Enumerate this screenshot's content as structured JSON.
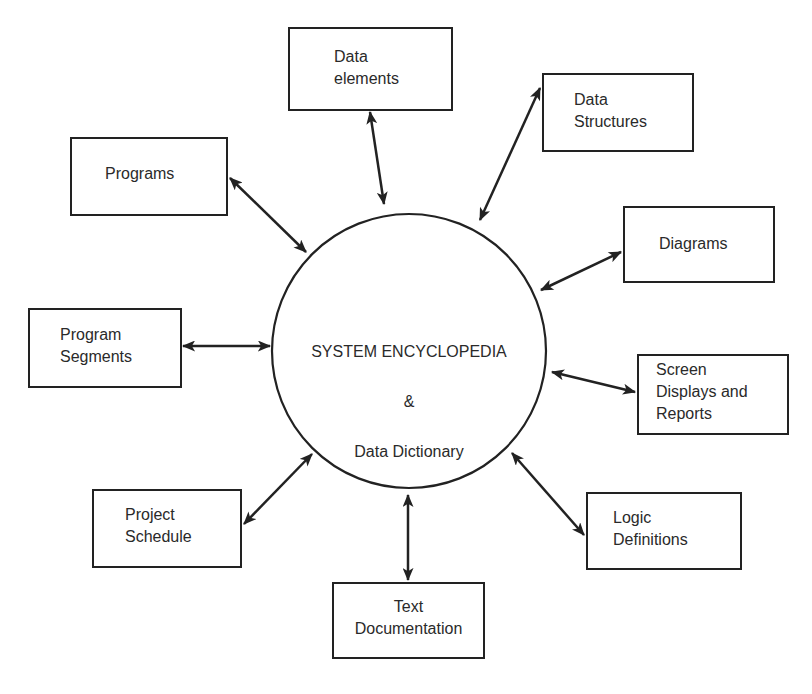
{
  "diagram": {
    "center": {
      "title": "SYSTEM ENCYCLOPEDIA",
      "ampersand": "&",
      "subtitle": "Data Dictionary"
    },
    "nodes": [
      {
        "id": "data-elements",
        "label": "Data\nelements"
      },
      {
        "id": "data-structures",
        "label": "Data\nStructures"
      },
      {
        "id": "programs",
        "label": "Programs"
      },
      {
        "id": "diagrams",
        "label": "Diagrams"
      },
      {
        "id": "program-segments",
        "label": "Program\nSegments"
      },
      {
        "id": "screen-displays-reports",
        "label": "Screen\nDisplays and\nReports"
      },
      {
        "id": "project-schedule",
        "label": "Project\nSchedule"
      },
      {
        "id": "logic-definitions",
        "label": "Logic\nDefinitions"
      },
      {
        "id": "text-documentation",
        "label": "Text\nDocumentation"
      }
    ],
    "edges": [
      {
        "from": "data-elements",
        "to": "center",
        "type": "bidirectional"
      },
      {
        "from": "data-structures",
        "to": "center",
        "type": "bidirectional"
      },
      {
        "from": "programs",
        "to": "center",
        "type": "bidirectional"
      },
      {
        "from": "diagrams",
        "to": "center",
        "type": "bidirectional"
      },
      {
        "from": "program-segments",
        "to": "center",
        "type": "bidirectional"
      },
      {
        "from": "screen-displays-reports",
        "to": "center",
        "type": "bidirectional"
      },
      {
        "from": "project-schedule",
        "to": "center",
        "type": "bidirectional"
      },
      {
        "from": "logic-definitions",
        "to": "center",
        "type": "bidirectional"
      },
      {
        "from": "text-documentation",
        "to": "center",
        "type": "bidirectional"
      }
    ]
  }
}
